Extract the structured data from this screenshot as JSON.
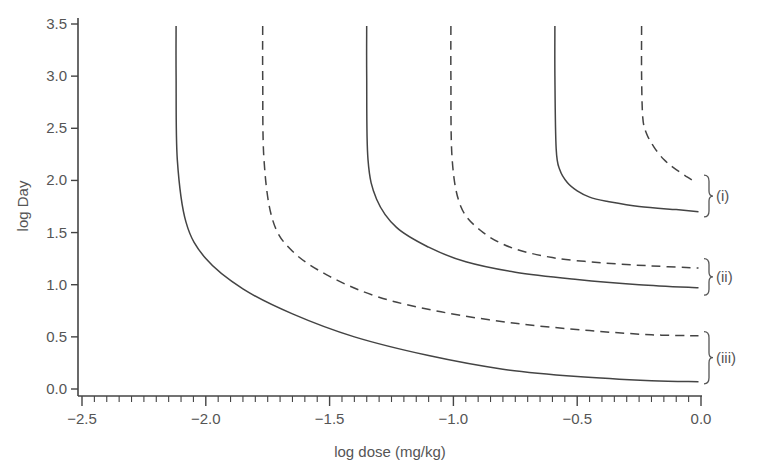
{
  "chart_data": {
    "type": "line",
    "title": "",
    "xlabel": "log dose (mg/kg)",
    "ylabel": "log Day",
    "xlim": [
      -2.5,
      0.0
    ],
    "ylim": [
      0.0,
      3.5
    ],
    "x_ticks": [
      "-2.5",
      "-2.0",
      "-1.5",
      "-1.0",
      "-0.5",
      "0.0"
    ],
    "y_ticks": [
      "0.0",
      "0.5",
      "1.0",
      "1.5",
      "2.0",
      "2.5",
      "3.0",
      "3.5"
    ],
    "x_minor_tick_step": 0.05,
    "grid": false,
    "legend": "none",
    "annotations": [
      {
        "label": "(i)",
        "y_range": [
          1.65,
          2.05
        ]
      },
      {
        "label": "(ii)",
        "y_range": [
          0.9,
          1.25
        ]
      },
      {
        "label": "(iii)",
        "y_range": [
          0.05,
          0.55
        ]
      }
    ],
    "series": [
      {
        "name": "(i) solid",
        "group": "(i)",
        "style": "solid",
        "x": [
          -0.59,
          -0.59,
          -0.585,
          -0.57,
          -0.54,
          -0.5,
          -0.45,
          -0.38,
          -0.25,
          -0.1,
          -0.01
        ],
        "y": [
          3.48,
          3.0,
          2.3,
          2.1,
          1.98,
          1.9,
          1.84,
          1.8,
          1.75,
          1.72,
          1.7
        ]
      },
      {
        "name": "(i) dashed",
        "group": "(i)",
        "style": "dashed",
        "x": [
          -0.24,
          -0.24,
          -0.235,
          -0.22,
          -0.19,
          -0.15,
          -0.11,
          -0.06,
          -0.02
        ],
        "y": [
          3.48,
          3.0,
          2.6,
          2.45,
          2.32,
          2.2,
          2.12,
          2.04,
          1.98
        ]
      },
      {
        "name": "(ii) solid",
        "group": "(ii)",
        "style": "solid",
        "x": [
          -1.35,
          -1.35,
          -1.345,
          -1.31,
          -1.23,
          -1.1,
          -0.95,
          -0.75,
          -0.5,
          -0.25,
          -0.01
        ],
        "y": [
          3.48,
          3.0,
          2.2,
          1.82,
          1.55,
          1.36,
          1.22,
          1.12,
          1.05,
          1.0,
          0.97
        ]
      },
      {
        "name": "(ii) dashed",
        "group": "(ii)",
        "style": "dashed",
        "x": [
          -1.01,
          -1.01,
          -1.005,
          -0.97,
          -0.89,
          -0.77,
          -0.6,
          -0.4,
          -0.2,
          -0.01
        ],
        "y": [
          3.48,
          3.0,
          2.2,
          1.75,
          1.52,
          1.36,
          1.26,
          1.21,
          1.18,
          1.16
        ]
      },
      {
        "name": "(iii) solid",
        "group": "(iii)",
        "style": "solid",
        "x": [
          -2.12,
          -2.12,
          -2.115,
          -2.08,
          -2.0,
          -1.85,
          -1.65,
          -1.4,
          -1.1,
          -0.8,
          -0.5,
          -0.2,
          -0.01
        ],
        "y": [
          3.48,
          3.0,
          2.2,
          1.6,
          1.25,
          0.96,
          0.72,
          0.5,
          0.32,
          0.19,
          0.12,
          0.08,
          0.07
        ]
      },
      {
        "name": "(iii) dashed",
        "group": "(iii)",
        "style": "dashed",
        "x": [
          -1.77,
          -1.77,
          -1.765,
          -1.73,
          -1.65,
          -1.5,
          -1.3,
          -1.05,
          -0.75,
          -0.45,
          -0.2,
          -0.01
        ],
        "y": [
          3.48,
          3.0,
          2.2,
          1.62,
          1.32,
          1.08,
          0.88,
          0.74,
          0.63,
          0.56,
          0.52,
          0.51
        ]
      }
    ]
  }
}
